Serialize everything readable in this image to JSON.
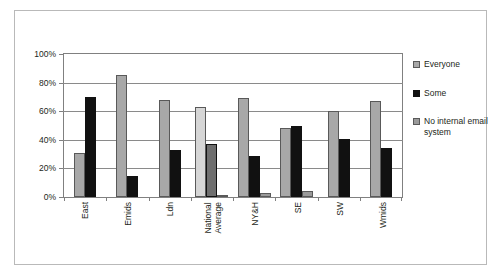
{
  "chart_data": {
    "type": "bar",
    "title": "",
    "subtitle": "",
    "xlabel": "",
    "ylabel": "",
    "ylim": [
      0,
      100
    ],
    "ytick_labels": [
      "100%",
      "80%",
      "60%",
      "40%",
      "20%",
      "0%"
    ],
    "ytick_values": [
      100,
      80,
      60,
      40,
      20,
      0
    ],
    "grid": "horizontal",
    "legend_position": "right",
    "categories": [
      "East",
      "Emids",
      "Ldn",
      "National Average",
      "NY&H",
      "SE",
      "SW",
      "Wmids"
    ],
    "series": [
      {
        "name": "Everyone",
        "color": "#a8a8a8",
        "values": [
          31,
          85,
          68,
          63,
          69,
          48,
          60,
          67
        ]
      },
      {
        "name": "Some",
        "color": "#111111",
        "values": [
          70,
          15,
          33,
          37,
          29,
          49.5,
          40.5,
          34
        ]
      },
      {
        "name": "No internal email system",
        "color": "#9a9a9a",
        "values": [
          0,
          0,
          0,
          1.5,
          3,
          4,
          0,
          0
        ]
      }
    ]
  },
  "legend": {
    "items": [
      {
        "label": "Everyone",
        "swatch": "light-grey-swatch"
      },
      {
        "label": "Some",
        "swatch": "black-swatch"
      },
      {
        "label": "No internal email system",
        "swatch": "grey-swatch"
      }
    ]
  },
  "xlabels": [
    {
      "line1": "East",
      "line2": ""
    },
    {
      "line1": "Emids",
      "line2": ""
    },
    {
      "line1": "Ldn",
      "line2": ""
    },
    {
      "line1": "National",
      "line2": "Average"
    },
    {
      "line1": "NY&H",
      "line2": ""
    },
    {
      "line1": "SE",
      "line2": ""
    },
    {
      "line1": "SW",
      "line2": ""
    },
    {
      "line1": "Wmids",
      "line2": ""
    }
  ]
}
